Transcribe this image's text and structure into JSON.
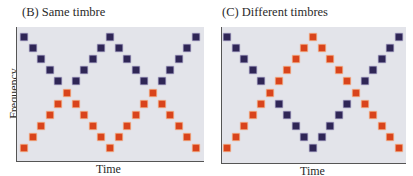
{
  "panels": [
    {
      "id": "B",
      "title": "(B)  Same timbre",
      "xlabel": "Time",
      "plot": {
        "left": 16,
        "top": 27,
        "width": 188,
        "height": 135
      },
      "x0": 24,
      "dx": 8.6,
      "series": {
        "blue": [
          0,
          1,
          2,
          3,
          4,
          null,
          4,
          3,
          2,
          1,
          0,
          1,
          2,
          3,
          4,
          null,
          4,
          3,
          2,
          1,
          0
        ],
        "orange": [
          10,
          9,
          8,
          7,
          6,
          5,
          6,
          7,
          8,
          9,
          10,
          9,
          8,
          7,
          6,
          5,
          6,
          7,
          8,
          9,
          10
        ]
      }
    },
    {
      "id": "C",
      "title": "(C)  Different timbres",
      "xlabel": "Time",
      "plot": {
        "left": 221,
        "top": 27,
        "width": 185,
        "height": 137
      },
      "x0": 227,
      "dx": 8.6,
      "series": {
        "blue": [
          0,
          1,
          2,
          3,
          4,
          null,
          6,
          7,
          8,
          9,
          10,
          9,
          8,
          7,
          6,
          null,
          4,
          3,
          2,
          1,
          0
        ],
        "orange": [
          10,
          9,
          8,
          7,
          6,
          5,
          4,
          3,
          2,
          1,
          0,
          1,
          2,
          3,
          4,
          5,
          6,
          7,
          8,
          9,
          10
        ]
      }
    }
  ],
  "ylabel": "Frequency",
  "level_y0": 37,
  "level_dy": 11.1,
  "square_size": 6,
  "colors": {
    "blue": "#2f2656",
    "orange": "#d9441c",
    "background": "#e3e4ea"
  },
  "chart_data": [
    {
      "type": "scatter",
      "title": "(B) Same timbre",
      "xlabel": "Time",
      "ylabel": "Frequency",
      "x": [
        0,
        1,
        2,
        3,
        4,
        5,
        6,
        7,
        8,
        9,
        10,
        11,
        12,
        13,
        14,
        15,
        16,
        17,
        18,
        19,
        20
      ],
      "series": [
        {
          "name": "tone sequence 1 (blue)",
          "values": [
            10,
            9,
            8,
            7,
            6,
            null,
            6,
            7,
            8,
            9,
            10,
            9,
            8,
            7,
            6,
            null,
            6,
            7,
            8,
            9,
            10
          ]
        },
        {
          "name": "tone sequence 2 (orange)",
          "values": [
            0,
            1,
            2,
            3,
            4,
            5,
            4,
            3,
            2,
            1,
            0,
            1,
            2,
            3,
            4,
            5,
            4,
            3,
            2,
            1,
            0
          ]
        }
      ],
      "note": "Frequency levels 0 (low) to 10 (high); perceived as bouncing streams"
    },
    {
      "type": "scatter",
      "title": "(C) Different timbres",
      "xlabel": "Time",
      "ylabel": "Frequency",
      "x": [
        0,
        1,
        2,
        3,
        4,
        5,
        6,
        7,
        8,
        9,
        10,
        11,
        12,
        13,
        14,
        15,
        16,
        17,
        18,
        19,
        20
      ],
      "series": [
        {
          "name": "tone sequence 1 (blue)",
          "values": [
            10,
            9,
            8,
            7,
            6,
            null,
            4,
            3,
            2,
            1,
            0,
            1,
            2,
            3,
            4,
            null,
            6,
            7,
            8,
            9,
            10
          ]
        },
        {
          "name": "tone sequence 2 (orange)",
          "values": [
            0,
            1,
            2,
            3,
            4,
            5,
            6,
            7,
            8,
            9,
            10,
            9,
            8,
            7,
            6,
            5,
            4,
            3,
            2,
            1,
            0
          ]
        }
      ],
      "note": "Frequency levels 0 (low) to 10 (high); streams cross when timbres differ"
    }
  ]
}
